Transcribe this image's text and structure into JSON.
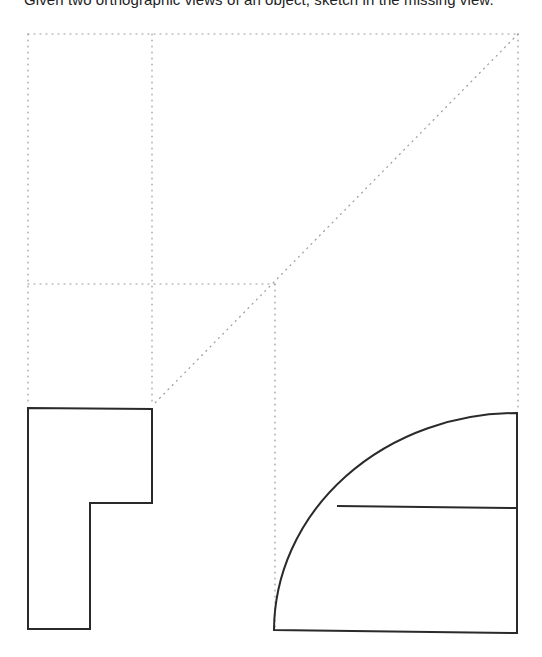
{
  "caption": {
    "text": "Given two orthographic views of an object, sketch in the missing view.",
    "visible_fragment": "sketch in the missing view.",
    "partially_cropped": true
  },
  "diagram": {
    "type": "orthographic-projection-exercise",
    "projection_grid": {
      "style": "dotted",
      "color": "#9a9a9a",
      "lines": [
        {
          "name": "top-horizontal",
          "x1": 28,
          "y1": 34,
          "x2": 518,
          "y2": 34
        },
        {
          "name": "middle-horizontal",
          "x1": 28,
          "y1": 284,
          "x2": 275,
          "y2": 284
        },
        {
          "name": "left-vertical",
          "x1": 28,
          "y1": 34,
          "x2": 28,
          "y2": 402
        },
        {
          "name": "inner-vertical",
          "x1": 152,
          "y1": 34,
          "x2": 152,
          "y2": 404
        },
        {
          "name": "projection-vertical",
          "x1": 275,
          "y1": 284,
          "x2": 275,
          "y2": 628
        },
        {
          "name": "right-vertical",
          "x1": 518,
          "y1": 34,
          "x2": 518,
          "y2": 410
        },
        {
          "name": "miter-diagonal",
          "x1": 518,
          "y1": 34,
          "x2": 152,
          "y2": 406
        }
      ]
    },
    "views": [
      {
        "name": "front-view-l-shape",
        "style": "solid",
        "color": "#2a2a2a",
        "points": [
          [
            28,
            408
          ],
          [
            152,
            409
          ],
          [
            152,
            503
          ],
          [
            90,
            503
          ],
          [
            90,
            629
          ],
          [
            28,
            629
          ]
        ]
      },
      {
        "name": "side-view-quarter-round",
        "style": "solid",
        "color": "#2a2a2a",
        "arc": {
          "start": [
            517,
            413
          ],
          "end": [
            274,
            630
          ],
          "rx": 243,
          "ry": 218
        },
        "bottom_edge": {
          "x1": 274,
          "y1": 630,
          "x2": 517,
          "y2": 633
        },
        "right_edge": {
          "x1": 517,
          "y1": 633,
          "x2": 517,
          "y2": 413
        },
        "interior_line": {
          "x1": 337,
          "y1": 506,
          "x2": 517,
          "y2": 508
        }
      }
    ],
    "missing_view_region": {
      "x": 28,
      "y": 34,
      "width": 124,
      "height": 250,
      "label": "top-view-to-sketch"
    }
  }
}
